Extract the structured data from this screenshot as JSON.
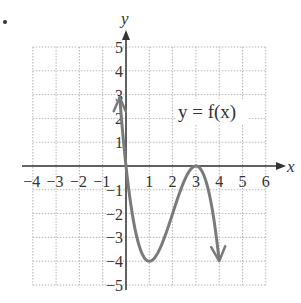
{
  "chart_data": {
    "type": "line",
    "title": "",
    "function_label": "y = f(x)",
    "xlabel": "x",
    "ylabel": "y",
    "xlim": [
      -4,
      6
    ],
    "ylim": [
      -5,
      5
    ],
    "grid": true,
    "x_ticks": [
      "−4",
      "−3",
      "−2",
      "−1",
      "1",
      "2",
      "3",
      "4",
      "5",
      "6"
    ],
    "y_ticks": [
      "5",
      "4",
      "3",
      "2",
      "1",
      "−1",
      "−2",
      "−3",
      "−4",
      "−5"
    ],
    "curve_color": "#777777",
    "points": [
      {
        "x": -0.25,
        "y": 5
      },
      {
        "x": 0,
        "y": 0
      },
      {
        "x": 1,
        "y": -4
      },
      {
        "x": 3,
        "y": 0
      },
      {
        "x": 4,
        "y": -5
      }
    ],
    "key_points": {
      "zeros": [
        0,
        3
      ],
      "local_min": {
        "x": 1,
        "y": -4
      },
      "local_max": {
        "x": 3,
        "y": 0
      }
    },
    "end_behavior": {
      "left": "arrow up",
      "right": "arrow down"
    }
  }
}
